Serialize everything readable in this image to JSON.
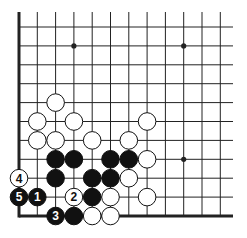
{
  "diagram": {
    "type": "go-problem",
    "grid": {
      "origin_x": 19,
      "origin_y": 27,
      "spacing_x": 18.3,
      "spacing_y": 18.9,
      "columns": 12,
      "rows": 11,
      "top_y": 12,
      "right_x": 233,
      "left_edge": true,
      "bottom_edge": true,
      "line_color": "#222222",
      "edge_width": 3
    },
    "star_points": [
      {
        "col": 3,
        "row": 1
      },
      {
        "col": 9,
        "row": 1
      },
      {
        "col": 9,
        "row": 7
      }
    ],
    "stones": [
      {
        "color": "white",
        "col": 2,
        "row": 4,
        "label": ""
      },
      {
        "color": "white",
        "col": 1,
        "row": 5,
        "label": ""
      },
      {
        "color": "white",
        "col": 3,
        "row": 5,
        "label": ""
      },
      {
        "color": "white",
        "col": 7,
        "row": 5,
        "label": ""
      },
      {
        "color": "white",
        "col": 1,
        "row": 6,
        "label": ""
      },
      {
        "color": "white",
        "col": 2,
        "row": 6,
        "label": ""
      },
      {
        "color": "white",
        "col": 4,
        "row": 6,
        "label": ""
      },
      {
        "color": "white",
        "col": 6,
        "row": 6,
        "label": ""
      },
      {
        "color": "black",
        "col": 2,
        "row": 7,
        "label": ""
      },
      {
        "color": "black",
        "col": 3,
        "row": 7,
        "label": ""
      },
      {
        "color": "black",
        "col": 5,
        "row": 7,
        "label": ""
      },
      {
        "color": "black",
        "col": 6,
        "row": 7,
        "label": ""
      },
      {
        "color": "white",
        "col": 7,
        "row": 7,
        "label": ""
      },
      {
        "color": "white",
        "col": 0,
        "row": 8,
        "label": "4"
      },
      {
        "color": "black",
        "col": 2,
        "row": 8,
        "label": ""
      },
      {
        "color": "black",
        "col": 4,
        "row": 8,
        "label": ""
      },
      {
        "color": "black",
        "col": 5,
        "row": 8,
        "label": ""
      },
      {
        "color": "white",
        "col": 6,
        "row": 8,
        "label": ""
      },
      {
        "color": "black",
        "col": 0,
        "row": 9,
        "label": "5"
      },
      {
        "color": "black",
        "col": 1,
        "row": 9,
        "label": "1"
      },
      {
        "color": "white",
        "col": 3,
        "row": 9,
        "label": "2"
      },
      {
        "color": "black",
        "col": 4,
        "row": 9,
        "label": ""
      },
      {
        "color": "white",
        "col": 5,
        "row": 9,
        "label": ""
      },
      {
        "color": "white",
        "col": 7,
        "row": 9,
        "label": ""
      },
      {
        "color": "black",
        "col": 2,
        "row": 10,
        "label": "3"
      },
      {
        "color": "black",
        "col": 3,
        "row": 10,
        "label": ""
      },
      {
        "color": "white",
        "col": 4,
        "row": 10,
        "label": ""
      },
      {
        "color": "white",
        "col": 5,
        "row": 10,
        "label": ""
      }
    ],
    "colors": {
      "black_stone": "#111111",
      "white_stone": "#ffffff",
      "stone_outline": "#111111",
      "background": "#ffffff"
    }
  }
}
